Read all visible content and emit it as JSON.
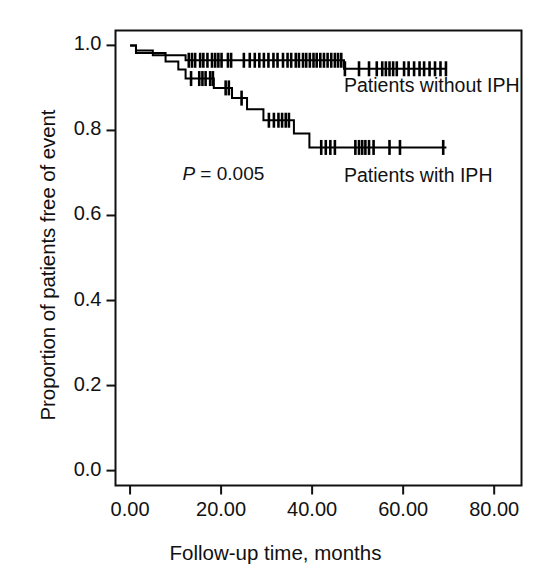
{
  "chart_data": {
    "type": "line",
    "subtype": "kaplan-meier-survival",
    "title": "",
    "xlabel": "Follow-up time, months",
    "ylabel": "Proportion of patients free of event",
    "xlim": [
      -3.2,
      86.0
    ],
    "ylim": [
      -0.035,
      1.035
    ],
    "xticks": [
      0,
      20,
      40,
      60,
      80
    ],
    "xticklabels": [
      "0.00",
      "20.00",
      "40.00",
      "60.00",
      "80.00"
    ],
    "yticks": [
      0.0,
      0.2,
      0.4,
      0.6,
      0.8,
      1.0
    ],
    "yticklabels": [
      "0.0",
      "0.2",
      "0.4",
      "0.6",
      "0.8",
      "1.0"
    ],
    "grid": false,
    "legend_position": "inline-right-of-curves",
    "annotations": [
      {
        "name": "p-value",
        "text_prefix": "P",
        "text_rest": " = 0.005",
        "x": 11.5,
        "y": 0.695
      }
    ],
    "series": [
      {
        "name": "Patients without IPH",
        "label_x": 47.0,
        "label_y": 0.905,
        "color": "#000000",
        "steps": [
          [
            0.0,
            1.0
          ],
          [
            1.3,
            1.0
          ],
          [
            1.3,
            0.988
          ],
          [
            5.0,
            0.988
          ],
          [
            5.0,
            0.977
          ],
          [
            12.2,
            0.977
          ],
          [
            12.2,
            0.965
          ],
          [
            47.0,
            0.965
          ],
          [
            47.0,
            0.945
          ],
          [
            69.5,
            0.945
          ]
        ],
        "censor_times": [
          12.9,
          13.6,
          14.3,
          15.4,
          16.1,
          17.0,
          18.0,
          18.7,
          19.4,
          20.1,
          21.5,
          22.2,
          25.0,
          26.3,
          27.4,
          28.4,
          29.4,
          30.4,
          31.5,
          32.4,
          33.6,
          34.6,
          35.4,
          36.4,
          37.1,
          38.0,
          38.7,
          39.5,
          40.3,
          41.0,
          41.8,
          42.6,
          43.4,
          44.2,
          45.0,
          45.7,
          46.4,
          47.2,
          50.3,
          52.5,
          54.2,
          55.4,
          56.2,
          57.0,
          57.8,
          58.6,
          60.2,
          61.2,
          62.4,
          63.6,
          64.6,
          65.8,
          67.0,
          68.2,
          69.4
        ]
      },
      {
        "name": "Patients with IPH",
        "label_x": 47.0,
        "label_y": 0.693,
        "color": "#000000",
        "steps": [
          [
            0.0,
            1.0
          ],
          [
            1.3,
            1.0
          ],
          [
            1.3,
            0.982
          ],
          [
            7.8,
            0.982
          ],
          [
            7.8,
            0.962
          ],
          [
            10.6,
            0.962
          ],
          [
            10.6,
            0.943
          ],
          [
            12.2,
            0.943
          ],
          [
            12.2,
            0.922
          ],
          [
            18.4,
            0.922
          ],
          [
            18.4,
            0.9
          ],
          [
            22.4,
            0.9
          ],
          [
            22.4,
            0.876
          ],
          [
            25.7,
            0.876
          ],
          [
            25.7,
            0.85
          ],
          [
            29.3,
            0.85
          ],
          [
            29.3,
            0.824
          ],
          [
            36.0,
            0.824
          ],
          [
            36.0,
            0.793
          ],
          [
            39.4,
            0.793
          ],
          [
            39.4,
            0.76
          ],
          [
            69.5,
            0.76
          ]
        ],
        "censor_times": [
          13.4,
          15.2,
          15.9,
          16.6,
          17.6,
          18.2,
          21.0,
          21.7,
          24.5,
          30.5,
          31.6,
          32.6,
          33.4,
          34.2,
          34.9,
          42.0,
          43.0,
          44.0,
          45.0,
          49.5,
          50.3,
          51.0,
          51.7,
          52.5,
          53.5,
          57.0,
          59.3,
          68.8
        ]
      }
    ]
  }
}
